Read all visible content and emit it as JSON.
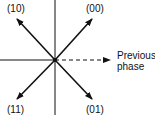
{
  "diagram": {
    "type": "phase-constellation",
    "labels": {
      "top_left": "(10)",
      "top_right": "(00)",
      "bottom_left": "(11)",
      "bottom_right": "(01)",
      "reference_line1": "Previous",
      "reference_line2": "phase"
    },
    "colors": {
      "stroke": "#111111",
      "background": "#ffffff"
    }
  }
}
